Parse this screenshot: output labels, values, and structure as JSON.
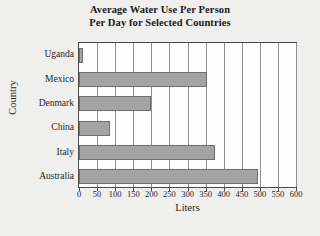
{
  "chart_data": {
    "type": "bar",
    "orientation": "horizontal",
    "title": "Average Water Use Per Person Per Day for Selected Countries",
    "title_lines": [
      "Average Water Use Per Person",
      "Per Day for Selected Countries"
    ],
    "categories": [
      "Uganda",
      "Mexico",
      "Denmark",
      "China",
      "Italy",
      "Australia"
    ],
    "values": [
      10,
      355,
      200,
      85,
      375,
      495
    ],
    "xlabel": "Liters",
    "ylabel": "Country",
    "xlim": [
      0,
      600
    ],
    "xticks": [
      0,
      50,
      100,
      150,
      200,
      250,
      300,
      350,
      400,
      450,
      500,
      550,
      600
    ],
    "xtick_labels": [
      "0",
      "50",
      "100",
      "150",
      "200",
      "250",
      "300",
      "350",
      "400",
      "450",
      "500",
      "550",
      "600"
    ],
    "grid": "vertical",
    "legend": "none",
    "bar_color": "#a3a3a3",
    "bar_edge_color": "#6f6f6f",
    "plot_background": "#fdfdfd",
    "page_background": "#efefee",
    "axis_color": "#4a4a4a"
  }
}
